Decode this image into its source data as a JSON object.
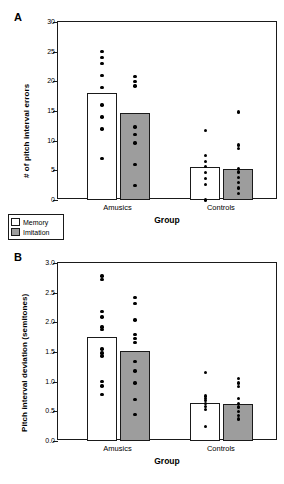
{
  "figure": {
    "background": "#ffffff",
    "bar_memory_color": "#ffffff",
    "bar_imitation_color": "#9d9d9d",
    "point_color": "#000000",
    "axis_color": "#1a1a1a"
  },
  "legend": {
    "entries": [
      {
        "label": "Memory",
        "swatch": "memory"
      },
      {
        "label": "Imitation",
        "swatch": "imitation"
      }
    ]
  },
  "panels": [
    {
      "label": "A"
    },
    {
      "label": "B"
    }
  ],
  "chart_data": [
    {
      "type": "bar",
      "panel": "A",
      "title": "",
      "xlabel": "Group",
      "ylabel": "# of pitch interval errors",
      "ylim": [
        0,
        30
      ],
      "yticks": [
        0,
        5,
        10,
        15,
        20,
        25,
        30
      ],
      "ytick_labels": [
        "0",
        "5",
        "10",
        "15",
        "20",
        "25",
        "30"
      ],
      "grid": false,
      "legend_position": "below-left",
      "categories": [
        "Amusics",
        "Controls"
      ],
      "series": [
        {
          "name": "Memory",
          "values": [
            18.1,
            5.5
          ]
        },
        {
          "name": "Imitation",
          "values": [
            14.6,
            5.2
          ]
        }
      ],
      "points": [
        {
          "category": "Amusics",
          "series": "Memory",
          "values": [
            25.0,
            24.0,
            23.0,
            21.0,
            19.0,
            16.0,
            14.0,
            12.0,
            7.0
          ]
        },
        {
          "category": "Amusics",
          "series": "Imitation",
          "values": [
            20.8,
            20.0,
            19.2,
            12.3,
            11.0,
            9.6,
            6.0,
            2.4
          ]
        },
        {
          "category": "Controls",
          "series": "Memory",
          "values": [
            11.7,
            7.5,
            6.5,
            5.6,
            4.6,
            3.6,
            2.6,
            0.0
          ]
        },
        {
          "category": "Controls",
          "series": "Imitation",
          "values": [
            14.8,
            9.3,
            8.7,
            5.3,
            4.7,
            3.8,
            2.9,
            2.0,
            1.1
          ]
        }
      ]
    },
    {
      "type": "bar",
      "panel": "B",
      "title": "",
      "xlabel": "Group",
      "ylabel": "Pitch interval deviation (semitones)",
      "ylim": [
        0.0,
        3.0
      ],
      "yticks": [
        0.0,
        0.5,
        1.0,
        1.5,
        2.0,
        2.5,
        3.0
      ],
      "ytick_labels": [
        "0.0",
        "0.5",
        "1.0",
        "1.5",
        "2.0",
        "2.5",
        "3.0"
      ],
      "grid": false,
      "legend_position": "above-left",
      "categories": [
        "Amusics",
        "Controls"
      ],
      "series": [
        {
          "name": "Memory",
          "values": [
            1.75,
            0.64
          ]
        },
        {
          "name": "Imitation",
          "values": [
            1.52,
            0.62
          ]
        }
      ],
      "points": [
        {
          "category": "Amusics",
          "series": "Memory",
          "values": [
            2.78,
            2.72,
            2.18,
            2.09,
            1.92,
            1.88,
            1.55,
            1.48,
            1.43,
            1.0,
            0.93,
            0.78
          ]
        },
        {
          "category": "Amusics",
          "series": "Imitation",
          "values": [
            2.42,
            2.32,
            2.04,
            1.8,
            1.73,
            1.66,
            1.34,
            1.18,
            0.98,
            0.7,
            0.45
          ]
        },
        {
          "category": "Controls",
          "series": "Memory",
          "values": [
            1.15,
            0.76,
            0.72,
            0.68,
            0.63,
            0.58,
            0.53,
            0.24
          ]
        },
        {
          "category": "Controls",
          "series": "Imitation",
          "values": [
            1.05,
            0.98,
            0.92,
            0.72,
            0.63,
            0.57,
            0.5,
            0.43,
            0.37
          ]
        }
      ]
    }
  ]
}
